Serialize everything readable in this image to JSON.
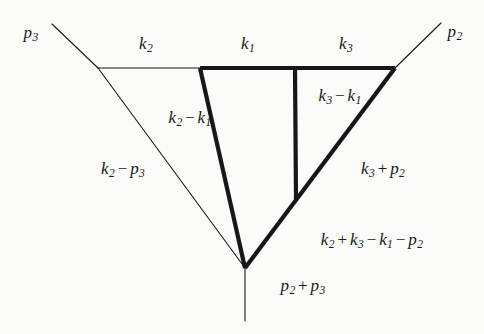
{
  "figure": {
    "background_color": "#fbfbfa",
    "line_color": "#171717",
    "thin_stroke_width": 1.1,
    "bold_stroke_width": 4.2,
    "external_legs": [
      {
        "name": "p3",
        "label": "p₃",
        "from": [
          98,
          68
        ],
        "to": [
          52,
          24
        ]
      },
      {
        "name": "p2",
        "label": "p₂",
        "from": [
          395,
          68
        ],
        "to": [
          441,
          23
        ]
      },
      {
        "name": "p2+p3",
        "label": "p₂ + p₃",
        "from": [
          245,
          268
        ],
        "to": [
          245,
          321
        ]
      }
    ],
    "thin_edges": [
      {
        "name": "k2-top",
        "from": [
          98,
          68
        ],
        "to": [
          200,
          68
        ]
      },
      {
        "name": "k2-p3-left",
        "from": [
          98,
          68
        ],
        "to": [
          245,
          268
        ]
      },
      {
        "name": "p3-leg",
        "from": [
          98,
          68
        ],
        "to": [
          52,
          24
        ]
      },
      {
        "name": "p2-leg",
        "from": [
          395,
          68
        ],
        "to": [
          441,
          23
        ]
      },
      {
        "name": "p2p3-leg",
        "from": [
          245,
          268
        ],
        "to": [
          245,
          321
        ]
      }
    ],
    "bold_edges": [
      {
        "name": "k1-top-left",
        "from": [
          200,
          68
        ],
        "to": [
          295,
          68
        ]
      },
      {
        "name": "k3-top-right",
        "from": [
          295,
          68
        ],
        "to": [
          395,
          68
        ]
      },
      {
        "name": "k2-k1-left",
        "from": [
          200,
          68
        ],
        "to": [
          245,
          268
        ]
      },
      {
        "name": "k3-p2-right",
        "from": [
          395,
          68
        ],
        "to": [
          245,
          268
        ]
      },
      {
        "name": "k3-k1-vertical",
        "from": [
          295,
          68
        ],
        "to": [
          296,
          199
        ]
      }
    ],
    "vertices": [
      {
        "name": "left-thin-vertex",
        "at": [
          98,
          68
        ]
      },
      {
        "name": "top-left-vertex",
        "at": [
          200,
          68
        ]
      },
      {
        "name": "top-mid-vertex",
        "at": [
          295,
          68
        ]
      },
      {
        "name": "top-right-vertex",
        "at": [
          395,
          68
        ]
      },
      {
        "name": "bottom-vertex",
        "at": [
          245,
          268
        ]
      },
      {
        "name": "inner-vertex",
        "at": [
          296,
          199
        ]
      }
    ],
    "crossing_point": [
      285,
      171
    ]
  },
  "labels": [
    {
      "name": "label-k2",
      "parts": [
        {
          "sym": "k",
          "sub": "2"
        }
      ],
      "x": 146,
      "y": 45
    },
    {
      "name": "label-k1",
      "parts": [
        {
          "sym": "k",
          "sub": "1"
        }
      ],
      "x": 248,
      "y": 45
    },
    {
      "name": "label-k3",
      "parts": [
        {
          "sym": "k",
          "sub": "3"
        }
      ],
      "x": 346,
      "y": 45
    },
    {
      "name": "label-p3",
      "parts": [
        {
          "sym": "p",
          "sub": "3"
        }
      ],
      "x": 31,
      "y": 34
    },
    {
      "name": "label-p2",
      "parts": [
        {
          "sym": "p",
          "sub": "2"
        }
      ],
      "x": 455,
      "y": 33
    },
    {
      "name": "label-k3-minus-k1",
      "parts": [
        {
          "sym": "k",
          "sub": "3"
        },
        {
          "op": "−"
        },
        {
          "sym": "k",
          "sub": "1"
        }
      ],
      "x": 340,
      "y": 97
    },
    {
      "name": "label-k2-minus-k1",
      "parts": [
        {
          "sym": "k",
          "sub": "2"
        },
        {
          "op": "−"
        },
        {
          "sym": "k",
          "sub": "1"
        }
      ],
      "x": 190,
      "y": 119
    },
    {
      "name": "label-k2-minus-p3",
      "parts": [
        {
          "sym": "k",
          "sub": "2"
        },
        {
          "op": "−"
        },
        {
          "sym": "p",
          "sub": "3"
        }
      ],
      "x": 123,
      "y": 170
    },
    {
      "name": "label-k3-plus-p2",
      "parts": [
        {
          "sym": "k",
          "sub": "3"
        },
        {
          "op": "+"
        },
        {
          "sym": "p",
          "sub": "2"
        }
      ],
      "x": 383,
      "y": 170
    },
    {
      "name": "label-k2-k3-k1-p2",
      "parts": [
        {
          "sym": "k",
          "sub": "2"
        },
        {
          "op": "+"
        },
        {
          "sym": "k",
          "sub": "3"
        },
        {
          "op": "−"
        },
        {
          "sym": "k",
          "sub": "1"
        },
        {
          "op": "−"
        },
        {
          "sym": "p",
          "sub": "2"
        }
      ],
      "x": 372,
      "y": 241
    },
    {
      "name": "label-p2-plus-p3",
      "parts": [
        {
          "sym": "p",
          "sub": "2"
        },
        {
          "op": "+"
        },
        {
          "sym": "p",
          "sub": "3"
        }
      ],
      "x": 303,
      "y": 287
    }
  ]
}
